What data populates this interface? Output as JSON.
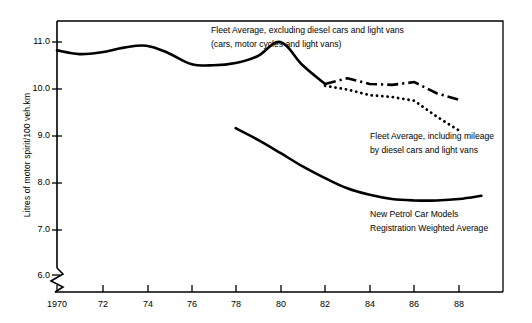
{
  "chart_data": {
    "type": "line",
    "title": "",
    "subtitle": "",
    "xlabel": "",
    "ylabel": "Litres of motor spirit/100 veh.km",
    "xlim": [
      1970,
      1989.1
    ],
    "ylim": [
      5.75,
      11.55
    ],
    "grid": false,
    "legend_position": "inline-annotations",
    "axis_break": {
      "axis": "y",
      "below": 6.0,
      "style": "zigzag"
    },
    "y_ticks": [
      "6.0",
      "7.0",
      "8.0",
      "9.0",
      "10.0",
      "11.0"
    ],
    "y_tick_values": [
      6.0,
      7.0,
      8.0,
      9.0,
      10.0,
      11.0
    ],
    "x_ticks": [
      "1970",
      "72",
      "74",
      "76",
      "78",
      "80",
      "82",
      "84",
      "86",
      "88"
    ],
    "x_tick_values": [
      1970,
      1972,
      1974,
      1976,
      1978,
      1980,
      1982,
      1984,
      1986,
      1988
    ],
    "series": [
      {
        "name": "Fleet Average, excluding diesel cars and light vans",
        "style": "solid",
        "x": [
          1970,
          1971,
          1972,
          1973,
          1974,
          1975,
          1976,
          1977,
          1978,
          1979,
          1980,
          1981,
          1982
        ],
        "values": [
          10.82,
          10.74,
          10.78,
          10.88,
          10.92,
          10.76,
          10.53,
          10.5,
          10.55,
          10.7,
          11.0,
          10.5,
          10.1
        ]
      },
      {
        "name": "Fleet Average, excluding diesel cars and light vans (dash-dot continuation)",
        "style": "dash-dot",
        "x": [
          1982,
          1983,
          1984,
          1985,
          1986,
          1987,
          1988
        ],
        "values": [
          10.1,
          10.22,
          10.1,
          10.08,
          10.14,
          9.9,
          9.76
        ]
      },
      {
        "name": "Fleet Average, including mileage by diesel cars and light vans",
        "style": "dotted",
        "x": [
          1982,
          1983,
          1984,
          1985,
          1986,
          1987,
          1988
        ],
        "values": [
          10.06,
          9.98,
          9.86,
          9.82,
          9.74,
          9.4,
          9.1
        ]
      },
      {
        "name": "New Petrol Car Models Registration Weighted Average",
        "style": "solid",
        "x": [
          1978,
          1979,
          1980,
          1981,
          1982,
          1983,
          1984,
          1985,
          1986,
          1987,
          1988,
          1989
        ],
        "values": [
          9.15,
          8.9,
          8.62,
          8.33,
          8.08,
          7.86,
          7.72,
          7.63,
          7.6,
          7.6,
          7.63,
          7.7
        ]
      }
    ],
    "annotations": [
      {
        "name": "annotation-fleet-excluding",
        "lines": [
          "Fleet Average, excluding diesel cars and light vans",
          "(cars, motor cycles and light vans)"
        ]
      },
      {
        "name": "annotation-fleet-including",
        "lines": [
          "Fleet Average, including mileage",
          "by diesel cars and light vans"
        ]
      },
      {
        "name": "annotation-new-petrol",
        "lines": [
          "New Petrol Car Models",
          "Registration Weighted Average"
        ]
      }
    ],
    "colors": {
      "axis": "#000000",
      "line": "#000000",
      "background": "#ffffff"
    }
  }
}
